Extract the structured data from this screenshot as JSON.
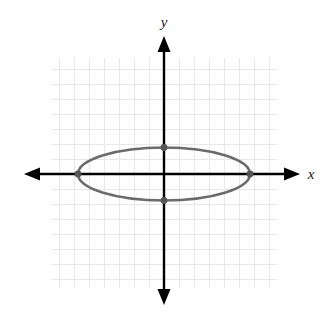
{
  "figure": {
    "kind": "coordinate-plane-ellipse",
    "width": 326,
    "height": 313,
    "background_color": "#ffffff"
  },
  "labels": {
    "y_axis_label": "y",
    "x_axis_label": "x"
  },
  "colors": {
    "grid": "#e8e8ea",
    "axis": "#000000",
    "curve": "#6b6b6b",
    "vertex_dot": "#555555",
    "label_text": "#1a1a1a"
  },
  "chart_data": {
    "type": "scatter",
    "title": "",
    "subtitle": "",
    "xlabel": "x",
    "ylabel": "y",
    "grid": true,
    "legend": false,
    "legend_position": "none",
    "axis_style": "double-arrow-cartesian",
    "tick_labels_shown": false,
    "grid_spacing_units": 1,
    "xlim": [
      -7.5,
      7.5
    ],
    "ylim": [
      -7.7,
      7.7
    ],
    "origin_pixel": [
      164,
      174
    ],
    "pixels_per_unit": [
      15,
      15
    ],
    "grid_extent_pixels": {
      "left": 52,
      "top": 58,
      "right": 277,
      "bottom": 288
    },
    "curves": [
      {
        "name": "ellipse",
        "equation": "x^2/36 + y^2/3.0625 = 1",
        "center": [
          0,
          0
        ],
        "semi_major_axis_a": 5.73,
        "semi_minor_axis_b": 1.77,
        "orientation": "horizontal",
        "color": "#6b6b6b",
        "line_width": 2.6
      }
    ],
    "points": [
      {
        "label": "left vertex",
        "x": -5.73,
        "y": 0,
        "marked": true
      },
      {
        "label": "right vertex",
        "x": 5.73,
        "y": 0,
        "marked": true
      },
      {
        "label": "top co-vertex",
        "x": 0,
        "y": 1.77,
        "marked": true
      },
      {
        "label": "bottom co-vertex",
        "x": 0,
        "y": -1.77,
        "marked": true
      }
    ],
    "annotations": []
  }
}
